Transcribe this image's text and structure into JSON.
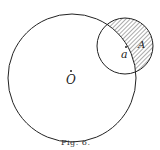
{
  "figure": {
    "caption": "Fig. 6.",
    "labels": {
      "big_center": "O",
      "small_center": "a",
      "region": "A"
    },
    "colors": {
      "stroke": "#222222",
      "hatch": "#444444",
      "background": "#ffffff"
    }
  }
}
